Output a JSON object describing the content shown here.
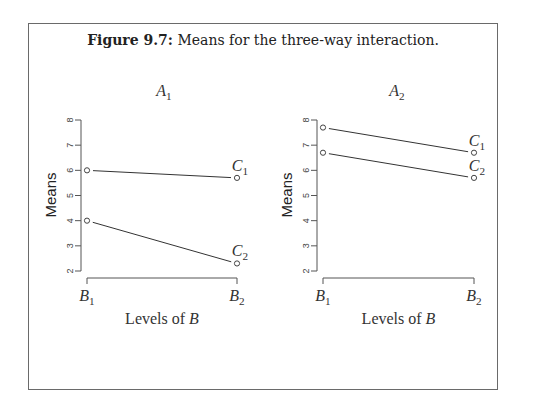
{
  "caption": {
    "label": "Figure 9.7:",
    "text": "Means for the three-way interaction."
  },
  "chart_data": [
    {
      "type": "line",
      "title": "A1",
      "xlabel": "Levels of B",
      "ylabel": "Means",
      "categories": [
        "B1",
        "B2"
      ],
      "yticks": [
        2,
        3,
        4,
        5,
        6,
        7,
        8
      ],
      "ylim": [
        2,
        8
      ],
      "grid": false,
      "series": [
        {
          "name": "C1",
          "values": [
            6.0,
            5.7
          ]
        },
        {
          "name": "C2",
          "values": [
            4.0,
            2.3
          ]
        }
      ]
    },
    {
      "type": "line",
      "title": "A2",
      "xlabel": "Levels of B",
      "ylabel": "Means",
      "categories": [
        "B1",
        "B2"
      ],
      "yticks": [
        2,
        3,
        4,
        5,
        6,
        7,
        8
      ],
      "ylim": [
        2,
        8
      ],
      "grid": false,
      "series": [
        {
          "name": "C1",
          "values": [
            7.7,
            6.7
          ]
        },
        {
          "name": "C2",
          "values": [
            6.7,
            5.7
          ]
        }
      ]
    }
  ],
  "panels": [
    {
      "title_main": "A",
      "title_sub": "1",
      "xlabel_main": "Levels of ",
      "xlabel_var": "B",
      "ylabel": "Means",
      "b1_main": "B",
      "b1_sub": "1",
      "b2_main": "B",
      "b2_sub": "2",
      "c1_main": "C",
      "c1_sub": "1",
      "c2_main": "C",
      "c2_sub": "2"
    },
    {
      "title_main": "A",
      "title_sub": "2",
      "xlabel_main": "Levels of ",
      "xlabel_var": "B",
      "ylabel": "Means",
      "b1_main": "B",
      "b1_sub": "1",
      "b2_main": "B",
      "b2_sub": "2",
      "c1_main": "C",
      "c1_sub": "1",
      "c2_main": "C",
      "c2_sub": "2"
    }
  ],
  "tick_labels": [
    "2",
    "3",
    "4",
    "5",
    "6",
    "7",
    "8"
  ]
}
